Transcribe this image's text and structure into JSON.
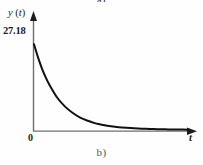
{
  "figure": {
    "caption_top": "a)",
    "caption_bottom": "b)",
    "background_color": "#fefefe",
    "ink_color": "#1c1c1c"
  },
  "labels": {
    "y_axis": "y (t)",
    "y_axis_var": "y",
    "y_axis_arg": "(t)",
    "x_axis": "t",
    "origin": "0",
    "initial_value": "27.18"
  },
  "chart_data": {
    "type": "line",
    "title": "",
    "subtitle": "",
    "xlabel": "t",
    "ylabel": "y (t)",
    "grid": false,
    "legend": null,
    "annotations": [
      {
        "text": "27.18",
        "x": 0,
        "y": 27.18,
        "position": "y-axis-tick"
      },
      {
        "text": "0",
        "x": 0,
        "y": 0,
        "position": "origin"
      }
    ],
    "xlim": [
      0,
      10
    ],
    "ylim": [
      0,
      31
    ],
    "axis_arrows": {
      "x": true,
      "y": true
    },
    "series": [
      {
        "name": "y(t)",
        "color": "#111111",
        "x": [
          0.0,
          0.25,
          0.5,
          0.75,
          1.0,
          1.5,
          2.0,
          2.5,
          3.0,
          3.5,
          4.0,
          4.5,
          5.0,
          5.5,
          6.0,
          6.5,
          7.0,
          7.5,
          8.0,
          8.5,
          9.0,
          9.5,
          10.0
        ],
        "y": [
          27.18,
          23.2,
          19.8,
          16.9,
          14.5,
          10.5,
          7.7,
          5.7,
          4.2,
          3.2,
          2.4,
          1.9,
          1.5,
          1.2,
          1.0,
          0.85,
          0.72,
          0.63,
          0.56,
          0.51,
          0.47,
          0.44,
          0.42
        ]
      }
    ]
  }
}
